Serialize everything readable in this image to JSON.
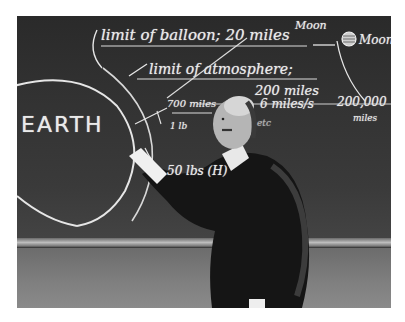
{
  "photo": {
    "subject": "man in dark suit pointing at chalkboard diagram",
    "style": "black-and-white photograph"
  },
  "chalkboard": {
    "earth_label": "EARTH",
    "line1": "limit of balloon; 20 miles",
    "line2a": "limit of atmosphere;",
    "line2b": "200 miles",
    "moon_label_top": "Moon",
    "moon_label_right": "Moon",
    "distance_label": "200,000",
    "distance_unit": "miles",
    "speed_label": "6 miles/s",
    "small_label_1": "700 miles",
    "small_label_2": "1 lb",
    "small_label_3": "etc",
    "lower_label": "50 lbs (H)"
  },
  "colors": {
    "chalk": "#eaeaea",
    "board": "#2e2e2e",
    "tray": "#bdbdbd",
    "wall": "#808080",
    "frame": "#ffffff"
  }
}
